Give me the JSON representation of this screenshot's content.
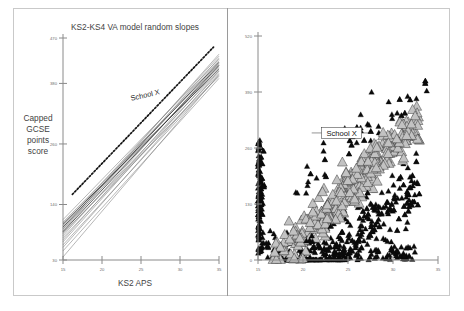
{
  "figure": {
    "width": 464,
    "height": 311,
    "background": "#ffffff",
    "frame_color": "#c9c9c9",
    "divider_color": "#9a9a9a"
  },
  "chart_data": [
    {
      "id": "left-panel",
      "type": "line",
      "title": "KS2-KS4 VA model random slopes",
      "xlabel": "KS2 APS",
      "ylabel": "Capped GCSE points score",
      "ylabel_lines": [
        "Capped",
        "GCSE",
        "points",
        "score"
      ],
      "xlim": [
        15,
        35
      ],
      "ylim": [
        30,
        470
      ],
      "xticks": [
        15,
        20,
        25,
        30,
        35
      ],
      "xticklabels": [
        "15",
        "20",
        "25",
        "30",
        "35"
      ],
      "yticks": [
        30,
        140,
        260,
        380,
        470
      ],
      "yticklabels": [
        "30",
        "140",
        "260",
        "380",
        "470"
      ],
      "grid": false,
      "legend": "none",
      "annotations": [
        {
          "text": "School X",
          "x": 25.6,
          "y": 352,
          "style": "plain"
        }
      ],
      "highlight_series": {
        "name": "School X",
        "style": "dashed",
        "color": "#151515",
        "x": [
          16.2,
          34.3
        ],
        "y": [
          160,
          452
        ]
      },
      "series": [
        {
          "name": "school-slope-01",
          "x": [
            15,
            35
          ],
          "y": [
            105,
            418
          ],
          "color": "#7b7b7b"
        },
        {
          "name": "school-slope-02",
          "x": [
            15,
            35
          ],
          "y": [
            98,
            425
          ],
          "color": "#7b7b7b"
        },
        {
          "name": "school-slope-03",
          "x": [
            15,
            35
          ],
          "y": [
            92,
            412
          ],
          "color": "#7b7b7b"
        },
        {
          "name": "school-slope-04",
          "x": [
            15,
            35
          ],
          "y": [
            88,
            430
          ],
          "color": "#7b7b7b"
        },
        {
          "name": "school-slope-05",
          "x": [
            15,
            35
          ],
          "y": [
            82,
            405
          ],
          "color": "#7b7b7b"
        },
        {
          "name": "school-slope-06",
          "x": [
            15,
            35
          ],
          "y": [
            78,
            420
          ],
          "color": "#7b7b7b"
        },
        {
          "name": "school-slope-07",
          "x": [
            15,
            35
          ],
          "y": [
            74,
            400
          ],
          "color": "#7b7b7b"
        },
        {
          "name": "school-slope-08",
          "x": [
            15,
            35
          ],
          "y": [
            70,
            415
          ],
          "color": "#7b7b7b"
        },
        {
          "name": "school-slope-09",
          "x": [
            15,
            35
          ],
          "y": [
            102,
            408
          ],
          "color": "#343434"
        },
        {
          "name": "school-slope-10",
          "x": [
            15,
            35
          ],
          "y": [
            95,
            422
          ],
          "color": "#343434"
        },
        {
          "name": "school-slope-11",
          "x": [
            15,
            35
          ],
          "y": [
            86,
            416
          ],
          "color": "#343434"
        },
        {
          "name": "school-slope-12",
          "x": [
            15,
            35
          ],
          "y": [
            66,
            410
          ],
          "color": "#7b7b7b"
        },
        {
          "name": "school-slope-13",
          "x": [
            15,
            35
          ],
          "y": [
            60,
            396
          ],
          "color": "#7b7b7b"
        },
        {
          "name": "school-slope-14",
          "x": [
            15,
            35
          ],
          "y": [
            55,
            404
          ],
          "color": "#7b7b7b"
        },
        {
          "name": "school-slope-15",
          "x": [
            15,
            35
          ],
          "y": [
            48,
            390
          ],
          "color": "#7b7b7b"
        },
        {
          "name": "school-slope-16",
          "x": [
            15,
            35
          ],
          "y": [
            36,
            398
          ],
          "color": "#7b7b7b"
        },
        {
          "name": "school-slope-17",
          "x": [
            15,
            35
          ],
          "y": [
            110,
            428
          ],
          "color": "#7b7b7b"
        },
        {
          "name": "school-slope-18",
          "x": [
            15,
            35
          ],
          "y": [
            99,
            434
          ],
          "color": "#7b7b7b"
        },
        {
          "name": "school-slope-19",
          "x": [
            15,
            35
          ],
          "y": [
            91,
            438
          ],
          "color": "#7b7b7b"
        },
        {
          "name": "school-slope-20",
          "x": [
            15,
            35
          ],
          "y": [
            84,
            394
          ],
          "color": "#7b7b7b"
        }
      ]
    },
    {
      "id": "right-panel",
      "type": "scatter",
      "title": "",
      "xlabel": "",
      "ylabel": "",
      "xlim": [
        15,
        35
      ],
      "ylim": [
        0,
        520
      ],
      "xticks": [
        15,
        20,
        25,
        30,
        35
      ],
      "xticklabels": [
        "15",
        "20",
        "25",
        "30",
        "35"
      ],
      "yticks": [
        0,
        130,
        260,
        390,
        520
      ],
      "yticklabels": [
        "0",
        "130",
        "260",
        "390",
        "520"
      ],
      "grid": false,
      "legend": "none",
      "annotations": [
        {
          "text": "School X",
          "x": 24.3,
          "y": 295,
          "style": "callout-box"
        }
      ],
      "marker_groups": [
        {
          "name": "gray-triangles",
          "marker": "triangle",
          "fill": "#c2c2c2",
          "edge": "#2a2a2a",
          "size": 9,
          "count": 320
        },
        {
          "name": "black-triangles",
          "marker": "triangle",
          "fill": "#0b0b0b",
          "edge": "#0b0b0b",
          "size": 5,
          "count": 520
        }
      ]
    }
  ]
}
